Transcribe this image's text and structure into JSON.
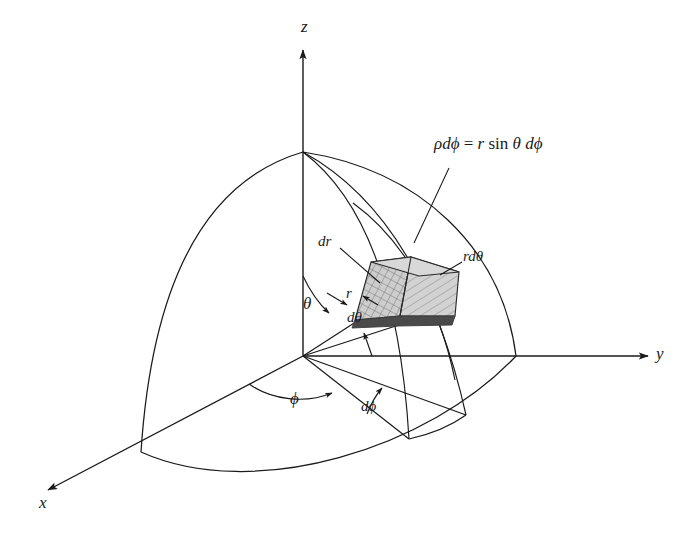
{
  "figure": {
    "background_color": "#ffffff",
    "stroke_color": "#1a1a1a",
    "element_fill_color": "#c8c8c8",
    "element_dark_edge_color": "#4a4a4a"
  },
  "axes": {
    "z_label": "z",
    "y_label": "y",
    "x_label": "x"
  },
  "angles": {
    "theta_label": "θ",
    "phi_label": "ϕ",
    "dtheta_label": "dθ",
    "dphi_label": "dϕ"
  },
  "lengths": {
    "r_label": "r",
    "dr_label": "dr",
    "rdtheta_label": "rdθ"
  },
  "equation": {
    "lhs": "ρdϕ",
    "eq": " = ",
    "rhs_r": "r",
    "rhs_sin": "sin",
    "rhs_theta": "θ",
    "rhs_dphi": "dϕ",
    "full": "ρdϕ = r sin θ dϕ"
  },
  "icons": {
    "z_arrow": "arrow-up-icon",
    "y_arrow": "arrow-right-icon",
    "x_arrow": "arrow-down-left-icon",
    "theta_arrow": "angle-arrow-icon",
    "phi_arrow": "angle-arrow-icon"
  }
}
